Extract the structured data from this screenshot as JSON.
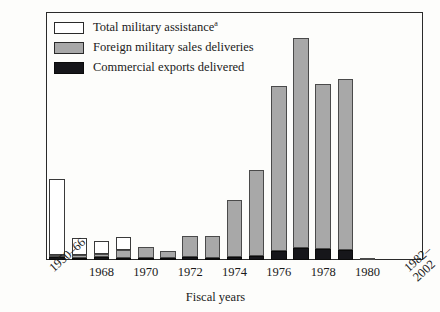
{
  "chart_data": {
    "type": "bar",
    "stacked": true,
    "title": "",
    "xlabel": "Fiscal years",
    "ylabel": "",
    "ylim": [
      0,
      2.8
    ],
    "yticks": [
      "0.5",
      "1.0",
      "1.5",
      "2.0",
      "2.5"
    ],
    "ytick_values": [
      0.5,
      1.0,
      1.5,
      2.0,
      2.5
    ],
    "grid": false,
    "legend_position": "top-left",
    "categories": [
      "1950-66",
      "1967",
      "1968",
      "1969",
      "1970",
      "1971",
      "1972",
      "1973",
      "1974",
      "1975",
      "1976",
      "1977",
      "1978",
      "1979",
      "1980",
      "1981",
      "1982-2002"
    ],
    "tick_labels": [
      {
        "category": "1950-66",
        "text": "1950–66",
        "rotated": true
      },
      {
        "category": "1968",
        "text": "1968",
        "rotated": false
      },
      {
        "category": "1970",
        "text": "1970",
        "rotated": false
      },
      {
        "category": "1972",
        "text": "1972",
        "rotated": false
      },
      {
        "category": "1974",
        "text": "1974",
        "rotated": false
      },
      {
        "category": "1976",
        "text": "1976",
        "rotated": false
      },
      {
        "category": "1978",
        "text": "1978",
        "rotated": false
      },
      {
        "category": "1980",
        "text": "1980",
        "rotated": false
      },
      {
        "category": "1982-2002",
        "text": "1982–\n2002",
        "rotated": true
      }
    ],
    "series": [
      {
        "name": "Commercial exports delivered",
        "color": "#16161a",
        "values": [
          0.03,
          0.02,
          0.03,
          0.02,
          0.02,
          0.02,
          0.03,
          0.02,
          0.03,
          0.04,
          0.1,
          0.14,
          0.13,
          0.11,
          0.0,
          0.0,
          0.0
        ]
      },
      {
        "name": "Foreign military sales deliveries",
        "color": "#a8a8a8",
        "values": [
          0.02,
          0.03,
          0.04,
          0.09,
          0.13,
          0.08,
          0.24,
          0.25,
          0.65,
          0.98,
          1.87,
          2.37,
          1.86,
          1.93,
          0.02,
          0.0,
          0.0
        ]
      },
      {
        "name": "Total military assistance",
        "color": "#ffffff",
        "values": [
          0.86,
          0.2,
          0.14,
          0.15,
          0.0,
          0.0,
          0.0,
          0.0,
          0.0,
          0.0,
          0.0,
          0.0,
          0.0,
          0.0,
          0.0,
          0.0,
          0.0
        ]
      }
    ],
    "totals": [
      0.91,
      0.25,
      0.21,
      0.26,
      0.15,
      0.1,
      0.27,
      0.27,
      0.68,
      1.02,
      1.97,
      2.51,
      1.99,
      2.04,
      0.02,
      0.0,
      0.0
    ]
  },
  "legend": {
    "items": [
      {
        "label": "Total military assistance",
        "superscript": "a",
        "swatch": "white-square-icon"
      },
      {
        "label": "Foreign military sales deliveries",
        "superscript": "",
        "swatch": "gray-square-icon"
      },
      {
        "label": "Commercial exports delivered",
        "superscript": "",
        "swatch": "black-square-icon"
      }
    ]
  },
  "axis": {
    "x_title": "Fiscal years"
  }
}
